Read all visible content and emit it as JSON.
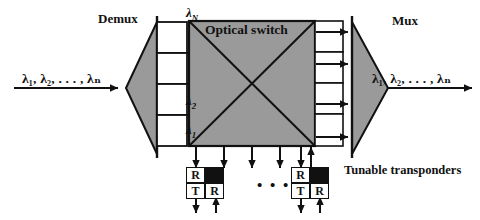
{
  "figure": {
    "background": "#ffffff",
    "ink": "#111111",
    "fill_gray": "#9a9a9a"
  },
  "labels": {
    "demux": "Demux",
    "mux": "Mux",
    "optical_switch": "Optical switch",
    "tunable_transponders": "Tunable transponders",
    "input_wavelengths": "λ₁, λ₂, . . . , λₙ",
    "output_wavelengths": "λ₁, λ₂, . . . , λₙ",
    "ellipsis": "• • •"
  },
  "demux_ports": [
    {
      "id": "port-lambda-N",
      "label": "λ",
      "sub": "N"
    },
    {
      "id": "port-blank",
      "label": "",
      "sub": ""
    },
    {
      "id": "port-lambda-2",
      "label": "λ",
      "sub": "2"
    },
    {
      "id": "port-lambda-1",
      "label": "λ",
      "sub": "1"
    }
  ],
  "transponders": [
    {
      "id": "transponder-left",
      "cells": [
        {
          "text": "R",
          "filled": false
        },
        {
          "text": "",
          "filled": true
        },
        {
          "text": "T",
          "filled": false
        },
        {
          "text": "R",
          "filled": false
        }
      ]
    },
    {
      "id": "transponder-right",
      "cells": [
        {
          "text": "R",
          "filled": false
        },
        {
          "text": "",
          "filled": true
        },
        {
          "text": "T",
          "filled": false
        },
        {
          "text": "R",
          "filled": false
        }
      ]
    }
  ],
  "counts": {
    "mux_output_arrows": 4,
    "switch_drop_arrows": 5,
    "switch_add_arrows": 1
  }
}
